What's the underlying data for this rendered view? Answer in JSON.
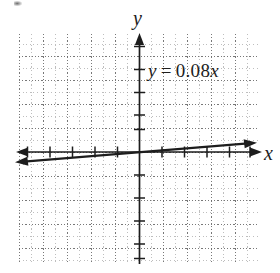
{
  "figure": {
    "type": "coordinate-grid-graph",
    "background_color": "#ffffff",
    "ink_color": "#1d1d1d",
    "grid_color": "#6e6e6e"
  },
  "axes": {
    "y_axis_label": "y",
    "x_axis_label": "x",
    "x_axis_arrows": "both",
    "y_axis_arrow": "up",
    "origin_px": {
      "x": 139,
      "y": 152
    },
    "grid_bounds_px": {
      "left": 19,
      "top": 34,
      "right": 258,
      "bottom": 264
    },
    "major_cell_px": 24,
    "minor_cell_px": 12,
    "x_major_ticks": 10,
    "y_major_ticks": 10
  },
  "annotation": {
    "equation_full": "y = 0.08x",
    "equation_lhs": "y",
    "equation_eq": "=",
    "equation_coefficient": "0.08",
    "equation_variable": "x"
  },
  "chart_data": {
    "type": "line",
    "title": "",
    "subtitle": "",
    "xlabel": "x",
    "ylabel": "y",
    "grid": true,
    "legend": "none",
    "annotations": [
      "y = 0.08x"
    ],
    "series": [
      {
        "name": "y = 0.08x",
        "equation": "y = 0.08x",
        "slope": 0.08,
        "intercept": 0,
        "arrows": "both",
        "x": [
          -5,
          -4,
          -3,
          -2,
          -1,
          0,
          1,
          2,
          3,
          4,
          5
        ],
        "values": [
          -0.4,
          -0.32,
          -0.24,
          -0.16,
          -0.08,
          0,
          0.08,
          0.16,
          0.24,
          0.32,
          0.4
        ]
      }
    ],
    "xlim": [
      -5,
      5
    ],
    "ylim": [
      -5,
      5
    ],
    "xtick_labels": [],
    "ytick_labels": []
  }
}
